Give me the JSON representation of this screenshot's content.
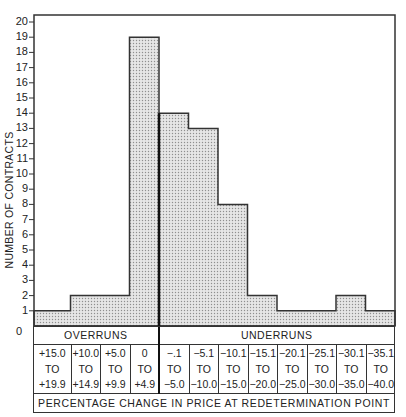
{
  "chart_data": {
    "type": "bar",
    "subtype": "histogram",
    "title": "",
    "xlabel": "PERCENTAGE CHANGE IN PRICE AT REDETERMINATION POINT",
    "ylabel": "NUMBER OF CONTRACTS",
    "ylim": [
      0,
      20
    ],
    "yticks": [
      0,
      1,
      2,
      3,
      4,
      5,
      6,
      7,
      8,
      9,
      10,
      11,
      12,
      13,
      14,
      15,
      16,
      17,
      18,
      19,
      20
    ],
    "grid": false,
    "legend": null,
    "groups": [
      {
        "label": "OVERRUNS",
        "bins": [
          0,
          1,
          2,
          3
        ]
      },
      {
        "label": "UNDERRUNS",
        "bins": [
          4,
          5,
          6,
          7,
          8,
          9,
          10,
          11
        ]
      }
    ],
    "categories": [
      "+15.0 TO +19.9",
      "+10.0 TO +14.9",
      "+5.0 TO +9.9",
      "0 TO +4.9",
      "-.1 TO -5.0",
      "-5.1 TO -10.0",
      "-10.1 TO -15.0",
      "-15.1 TO -20.0",
      "-20.1 TO -25.0",
      "-25.1 TO -30.0",
      "-30.1 TO -35.0",
      "-35.1 TO -40.0"
    ],
    "bins": [
      {
        "top": "+15.0",
        "mid": "TO",
        "bottom": "+19.9"
      },
      {
        "top": "+10.0",
        "mid": "TO",
        "bottom": "+14.9"
      },
      {
        "top": "+5.0",
        "mid": "TO",
        "bottom": "+9.9"
      },
      {
        "top": "0",
        "mid": "TO",
        "bottom": "+4.9"
      },
      {
        "top": "−.1",
        "mid": "TO",
        "bottom": "−5.0"
      },
      {
        "top": "−5.1",
        "mid": "TO",
        "bottom": "−10.0"
      },
      {
        "top": "−10.1",
        "mid": "TO",
        "bottom": "−15.0"
      },
      {
        "top": "−15.1",
        "mid": "TO",
        "bottom": "−20.0"
      },
      {
        "top": "−20.1",
        "mid": "TO",
        "bottom": "−25.0"
      },
      {
        "top": "−25.1",
        "mid": "TO",
        "bottom": "−30.0"
      },
      {
        "top": "−30.1",
        "mid": "TO",
        "bottom": "−35.0"
      },
      {
        "top": "−35.1",
        "mid": "TO",
        "bottom": "−40.0"
      }
    ],
    "values": [
      1,
      2,
      2,
      19,
      14,
      13,
      8,
      2,
      1,
      1,
      2,
      1
    ]
  },
  "colors": {
    "line": "#333333",
    "fill": "#d9d9d9",
    "dot": "#9a9a9a",
    "background": "#ffffff"
  }
}
